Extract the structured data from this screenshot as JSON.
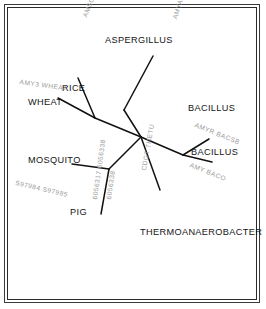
{
  "figure": {
    "type": "unrooted-phylogenetic-tree",
    "border_color": "#2b2b2b",
    "branch_color": "#111111",
    "taxon_label_color": "#141414",
    "accession_label_color": "#9b9b9b"
  },
  "taxa": [
    {
      "id": "aspergillus",
      "label": "ASPERGILLUS",
      "x": 105,
      "y": 36,
      "accession": "AMYA ASPOR",
      "acc_x": 172,
      "acc_y": 18,
      "acc_rot": 72
    },
    {
      "id": "rice",
      "label": "RICE",
      "x": 62,
      "y": 84,
      "accession": "AMSC ORYSA",
      "acc_x": 82,
      "acc_y": 16,
      "acc_rot": 68
    },
    {
      "id": "wheat",
      "label": "WHEAT",
      "x": 28,
      "y": 98,
      "accession": "AMY3 WHEAT",
      "acc_x": 20,
      "acc_y": 79,
      "acc_rot": -8
    },
    {
      "id": "bacillus-1",
      "label": "BACILLUS",
      "x": 188,
      "y": 104,
      "accession": "AMYR BACSB",
      "acc_x": 196,
      "acc_y": 122,
      "acc_rot": -22
    },
    {
      "id": "bacillus-2",
      "label": "BACILLUS",
      "x": 191,
      "y": 148,
      "accession": "AMY BACO",
      "acc_x": 191,
      "acc_y": 162,
      "acc_rot": -22
    },
    {
      "id": "thermoanaerobacter",
      "label": "THERMOANAEROBACTER",
      "x": 140,
      "y": 228,
      "accession": "CDGT THETU",
      "acc_x": 141,
      "acc_y": 170,
      "acc_rot": 80
    },
    {
      "id": "mosquito",
      "label": "MOSQUITO",
      "x": 28,
      "y": 156,
      "accession": "S97984 S97985",
      "acc_x": 16,
      "acc_y": 180,
      "acc_rot": -13
    },
    {
      "id": "pig",
      "label": "PIG",
      "x": 70,
      "y": 208,
      "accession": "6056317 6056338",
      "acc_x": 92,
      "acc_y": 199,
      "acc_rot": 82
    }
  ],
  "accessory_labels": [
    {
      "id": "pig-accession-2",
      "text": "6056338",
      "x": 106,
      "y": 199,
      "rot": 82
    }
  ],
  "branches": [
    {
      "id": "center-to-aspergillus-node",
      "x1": 141,
      "y1": 137,
      "x2": 124,
      "y2": 110
    },
    {
      "id": "aspergillus-node-to-tip",
      "x1": 124,
      "y1": 110,
      "x2": 153,
      "y2": 56
    },
    {
      "id": "center-to-plant-node",
      "x1": 141,
      "y1": 137,
      "x2": 95,
      "y2": 118
    },
    {
      "id": "plant-node-to-rice",
      "x1": 95,
      "y1": 118,
      "x2": 78,
      "y2": 78
    },
    {
      "id": "plant-node-to-wheat",
      "x1": 95,
      "y1": 118,
      "x2": 58,
      "y2": 98
    },
    {
      "id": "center-to-bacteria-node",
      "x1": 141,
      "y1": 137,
      "x2": 183,
      "y2": 155
    },
    {
      "id": "bacteria-node-to-bac1",
      "x1": 183,
      "y1": 155,
      "x2": 209,
      "y2": 139
    },
    {
      "id": "bacteria-node-to-bac2",
      "x1": 183,
      "y1": 155,
      "x2": 212,
      "y2": 162
    },
    {
      "id": "center-to-thermo",
      "x1": 141,
      "y1": 137,
      "x2": 160,
      "y2": 190
    },
    {
      "id": "center-to-animal-node",
      "x1": 141,
      "y1": 137,
      "x2": 109,
      "y2": 169
    },
    {
      "id": "animal-node-to-mosquito",
      "x1": 109,
      "y1": 169,
      "x2": 72,
      "y2": 164
    },
    {
      "id": "animal-node-to-pig",
      "x1": 109,
      "y1": 169,
      "x2": 101,
      "y2": 214
    }
  ]
}
